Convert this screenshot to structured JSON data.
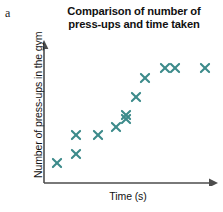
{
  "figure": {
    "part_label": "a",
    "title_lines": [
      "Comparison of number of",
      "press-ups and time taken"
    ],
    "marker_color": "#3d8b8b",
    "axis_color": "#4d4d4d",
    "background": "#ffffff",
    "text_color": "#121212"
  },
  "chart_data": {
    "type": "scatter",
    "title": "Comparison of number of press-ups and time taken",
    "xlabel": "Time (s)",
    "ylabel": "Number of press-ups in the gym",
    "grid": false,
    "legend": "none",
    "marker": "x",
    "marker_color": "#3d8b8b",
    "axis_arrows": true,
    "tick_labels_x": [],
    "tick_labels_y": [],
    "xlim": [
      0,
      100
    ],
    "ylim": [
      0,
      100
    ],
    "points": [
      {
        "x": 8,
        "y": 17
      },
      {
        "x": 19,
        "y": 23
      },
      {
        "x": 19,
        "y": 37
      },
      {
        "x": 32,
        "y": 37
      },
      {
        "x": 43,
        "y": 43
      },
      {
        "x": 49,
        "y": 49
      },
      {
        "x": 49,
        "y": 52
      },
      {
        "x": 55,
        "y": 65
      },
      {
        "x": 60,
        "y": 79
      },
      {
        "x": 72,
        "y": 86
      },
      {
        "x": 78,
        "y": 86
      },
      {
        "x": 96,
        "y": 86
      }
    ],
    "point_count": 12,
    "trend": "positive correlation"
  }
}
